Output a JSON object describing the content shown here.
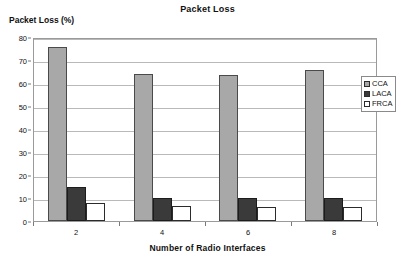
{
  "chart_data": {
    "type": "bar",
    "title": "Packet Loss",
    "xlabel": "Number of Radio Interfaces",
    "ylabel": "Packet Loss (%)",
    "categories": [
      "2",
      "4",
      "6",
      "8"
    ],
    "ylim": [
      0,
      80
    ],
    "yticks": [
      "0",
      "10",
      "20",
      "30",
      "40",
      "50",
      "60",
      "70",
      "80"
    ],
    "grid": true,
    "legend_position": "right",
    "series": [
      {
        "name": "CCA",
        "values": [
          75.5,
          64.0,
          63.5,
          65.5
        ],
        "color": "#a8a8a8"
      },
      {
        "name": "LACA",
        "values": [
          15.0,
          10.0,
          10.0,
          10.0
        ],
        "color": "#3a3a3a"
      },
      {
        "name": "FRCA",
        "values": [
          8.0,
          6.5,
          6.0,
          6.0
        ],
        "color": "#ffffff"
      }
    ]
  },
  "legend": {
    "items": [
      {
        "label": "CCA"
      },
      {
        "label": "LACA"
      },
      {
        "label": "FRCA"
      }
    ]
  }
}
